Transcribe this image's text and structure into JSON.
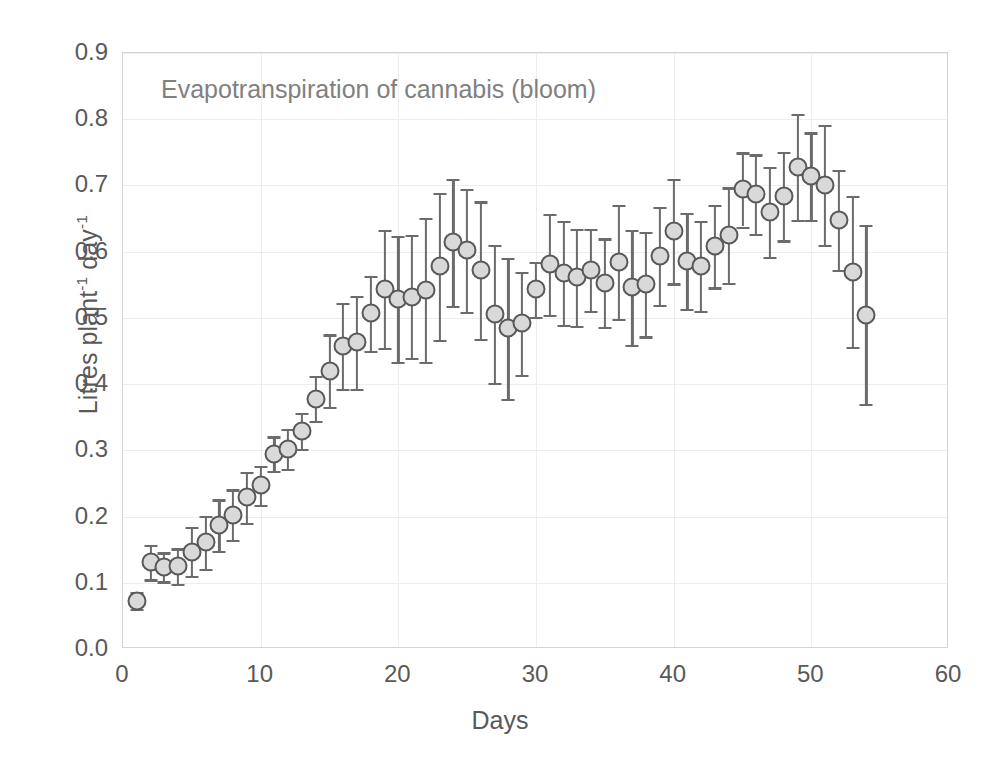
{
  "chart_data": {
    "type": "scatter",
    "title": "Evapotranspiration of cannabis (bloom)",
    "xlabel": "Days",
    "ylabel": "Litres plant-1 day-1",
    "ylabel_parts": {
      "base1": "Litres plant",
      "sup1": "-1",
      "base2": " day",
      "sup2": "-1"
    },
    "xlim": [
      0,
      60
    ],
    "ylim": [
      0.0,
      0.9
    ],
    "xticks": [
      0,
      10,
      20,
      30,
      40,
      50,
      60
    ],
    "yticks": [
      "0.0",
      "0.1",
      "0.2",
      "0.3",
      "0.4",
      "0.5",
      "0.6",
      "0.7",
      "0.8",
      "0.9"
    ],
    "grid": "horizontal-and-vertical",
    "legend": "none",
    "marker_style": "circle-filled-light-gray-dark-outline",
    "error_bars": "symmetric-standard-deviation",
    "colors": {
      "marker_fill": "#d9d9d9",
      "marker_edge": "#595959",
      "error_bar": "#6b6b6b",
      "grid": "#ededed",
      "axis_frame": "#d4d4d4",
      "text": "#595959",
      "title_text": "#808080"
    },
    "x": [
      1,
      2,
      3,
      4,
      5,
      6,
      7,
      8,
      9,
      10,
      11,
      12,
      13,
      14,
      15,
      16,
      17,
      18,
      19,
      20,
      21,
      22,
      23,
      24,
      25,
      26,
      27,
      28,
      29,
      30,
      31,
      32,
      33,
      34,
      35,
      36,
      37,
      38,
      39,
      40,
      41,
      42,
      43,
      44,
      45,
      46,
      47,
      48,
      49,
      50,
      51,
      52,
      53,
      54
    ],
    "y": [
      0.073,
      0.131,
      0.124,
      0.125,
      0.147,
      0.161,
      0.187,
      0.203,
      0.229,
      0.247,
      0.295,
      0.302,
      0.329,
      0.378,
      0.42,
      0.458,
      0.463,
      0.507,
      0.544,
      0.529,
      0.532,
      0.542,
      0.578,
      0.614,
      0.602,
      0.572,
      0.506,
      0.484,
      0.492,
      0.543,
      0.581,
      0.568,
      0.561,
      0.572,
      0.553,
      0.585,
      0.546,
      0.551,
      0.594,
      0.631,
      0.586,
      0.578,
      0.608,
      0.625,
      0.694,
      0.687,
      0.66,
      0.684,
      0.728,
      0.714,
      0.701,
      0.648,
      0.57,
      0.505
    ],
    "yerr": [
      0.013,
      0.026,
      0.022,
      0.027,
      0.037,
      0.04,
      0.039,
      0.038,
      0.039,
      0.03,
      0.026,
      0.03,
      0.027,
      0.034,
      0.055,
      0.065,
      0.07,
      0.057,
      0.089,
      0.095,
      0.093,
      0.109,
      0.111,
      0.096,
      0.093,
      0.104,
      0.104,
      0.106,
      0.078,
      0.042,
      0.076,
      0.079,
      0.073,
      0.062,
      0.067,
      0.086,
      0.087,
      0.079,
      0.074,
      0.079,
      0.073,
      0.068,
      0.062,
      0.072,
      0.056,
      0.06,
      0.068,
      0.067,
      0.08,
      0.066,
      0.091,
      0.076,
      0.114,
      0.135
    ]
  }
}
